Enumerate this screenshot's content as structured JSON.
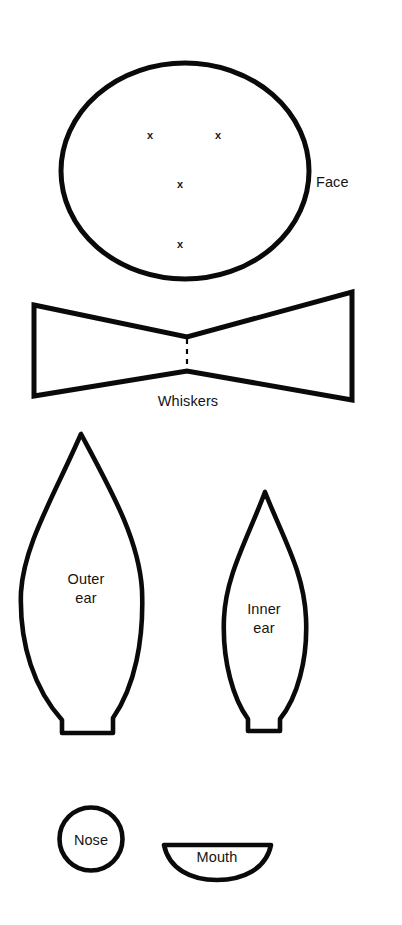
{
  "sheet": {
    "title": "Cat face felt pattern template",
    "width": 402,
    "height": 925,
    "background_color": "#ffffff",
    "ink_color": "#0a0a0a"
  },
  "pieces": [
    {
      "id": "face",
      "label": "Face",
      "shape": "ellipse",
      "label_x": 316,
      "label_y": 173,
      "label_align": "left",
      "stroke_width": 5.0,
      "geometry": {
        "cx": 185,
        "cy": 171,
        "rx": 124,
        "ry": 108
      }
    },
    {
      "id": "whiskers",
      "label": "Whiskers",
      "shape": "bowtie",
      "label_x": 188,
      "label_y": 392,
      "label_align": "center",
      "stroke_width": 5.0,
      "has_fold_line": true,
      "geometry": {
        "points": "34,305 352,292 352,400 34,396",
        "waist_x": 187,
        "waist_top_y": 336,
        "waist_bottom_y": 372
      }
    },
    {
      "id": "outer-ear",
      "label": "Outer\near",
      "shape": "leaf",
      "label_x": 86,
      "label_y": 570,
      "label_align": "center",
      "stroke_width": 4.6,
      "geometry": {
        "apex_x": 81,
        "apex_y": 434,
        "base_left_x": 62,
        "base_right_x": 113,
        "base_y": 733,
        "widest_left_x": 21,
        "widest_right_x": 142,
        "widest_y": 588,
        "shoulder_y": 706
      }
    },
    {
      "id": "inner-ear",
      "label": "Inner\near",
      "shape": "leaf",
      "label_x": 263,
      "label_y": 600,
      "label_align": "center",
      "stroke_width": 4.6,
      "geometry": {
        "apex_x": 265,
        "apex_y": 492,
        "base_left_x": 248,
        "base_right_x": 280,
        "base_y": 731,
        "widest_left_x": 224,
        "widest_right_x": 306,
        "widest_y": 617,
        "shoulder_y": 710
      }
    },
    {
      "id": "nose",
      "label": "Nose",
      "shape": "circle",
      "label_x": 91,
      "label_y": 831,
      "label_align": "center",
      "stroke_width": 4.6,
      "geometry": {
        "cx": 91,
        "cy": 839,
        "r": 32
      }
    },
    {
      "id": "mouth",
      "label": "Mouth",
      "shape": "half-moon",
      "label_x": 217,
      "label_y": 848,
      "label_align": "center",
      "stroke_width": 4.6,
      "geometry": {
        "left_x": 163,
        "right_x": 272,
        "top_y": 845,
        "bottom_y": 879
      }
    }
  ],
  "placement_marks": {
    "symbol": "x",
    "description": "x marks inside the Face piece showing feature placement",
    "points": [
      {
        "id": "left-eye",
        "x": 151,
        "y": 136
      },
      {
        "id": "right-eye",
        "x": 219,
        "y": 136
      },
      {
        "id": "nose-center",
        "x": 181,
        "y": 185
      },
      {
        "id": "mouth-center",
        "x": 181,
        "y": 245
      }
    ]
  }
}
